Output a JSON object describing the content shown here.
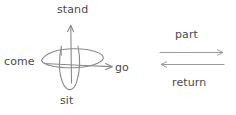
{
  "diagram": {
    "type": "hand-drawn-motion-verb-diagram",
    "background_color": "#ffffff",
    "stroke_color": "#8a8a8a",
    "text_color": "#4a4a4a",
    "left_panel": {
      "name": "axis-loop-diagram",
      "labels": {
        "up": "stand",
        "left": "come",
        "right": "go",
        "down": "sit"
      },
      "elements": [
        "vertical-arrow-up",
        "horizontal-arrow-right",
        "horizontal-ellipse-loop",
        "vertical-ellipse-loop"
      ]
    },
    "right_panel": {
      "name": "two-way-arrow-diagram",
      "labels": {
        "top": "part",
        "bottom": "return"
      },
      "elements": [
        "arrow-right",
        "arrow-left"
      ]
    }
  }
}
